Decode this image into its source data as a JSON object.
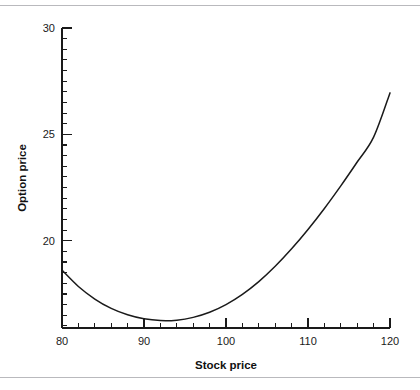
{
  "figure": {
    "background_color": "#ffffff",
    "line_color": "#1a1a1a",
    "rule_color": "#b9b9bd",
    "has_top_rule": true,
    "has_bottom_rule": true
  },
  "chart_data": {
    "type": "line",
    "title": "",
    "xlabel": "Stock price",
    "ylabel": "Option price",
    "xlim": [
      80,
      120
    ],
    "ylim": [
      15.9,
      30
    ],
    "grid": false,
    "legend": null,
    "x_ticks_major": [
      80,
      90,
      100,
      110,
      120
    ],
    "x_tick_labels": [
      "80",
      "90",
      "100",
      "110",
      "120"
    ],
    "x_minor_step": 2,
    "y_ticks_major": [
      20,
      25,
      30
    ],
    "y_tick_labels": [
      "20",
      "25",
      "30"
    ],
    "y_minor_step": 0.5,
    "series": [
      {
        "name": "Option price",
        "x": [
          80,
          82,
          84,
          86,
          88,
          90,
          92,
          94,
          96,
          98,
          100,
          102,
          104,
          106,
          108,
          110,
          112,
          114,
          116,
          118,
          120
        ],
        "y": [
          18.62,
          17.85,
          17.26,
          16.82,
          16.52,
          16.33,
          16.25,
          16.27,
          16.4,
          16.64,
          17.0,
          17.48,
          18.08,
          18.8,
          19.62,
          20.53,
          21.52,
          22.58,
          23.7,
          24.87,
          26.95
        ]
      }
    ],
    "minimum_point": {
      "x": 92.4,
      "y": 16.24
    },
    "endpoints": {
      "left": {
        "x": 80,
        "y": 18.62
      },
      "right": {
        "x": 120,
        "y": 26.95
      }
    }
  },
  "axis_titles": {
    "x": "Stock price",
    "y": "Option price"
  }
}
